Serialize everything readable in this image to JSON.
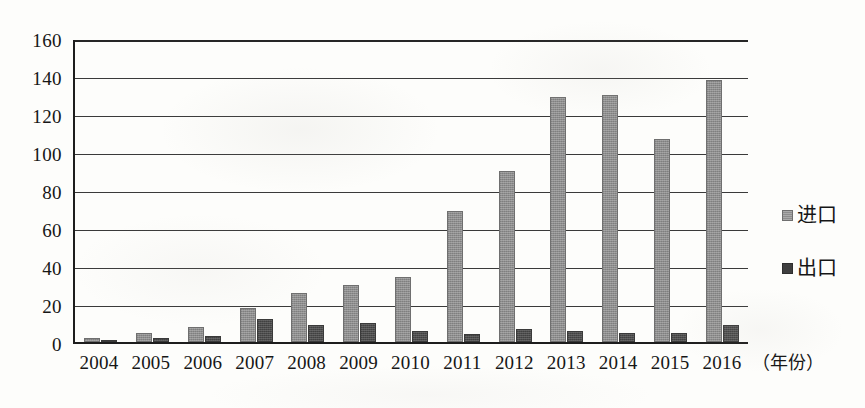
{
  "chart_data": {
    "type": "bar",
    "title": "",
    "subtitle": "",
    "xlabel": "（年份）",
    "ylabel": "",
    "ylim": [
      0,
      160
    ],
    "ytick_step": 20,
    "grid": true,
    "legend_position": "right",
    "categories": [
      "2004",
      "2005",
      "2006",
      "2007",
      "2008",
      "2009",
      "2010",
      "2011",
      "2012",
      "2013",
      "2014",
      "2015",
      "2016"
    ],
    "yticks": [
      "0",
      "20",
      "40",
      "60",
      "80",
      "100",
      "120",
      "140",
      "160"
    ],
    "series": [
      {
        "name": "进口",
        "color": "#8d8d8d",
        "values": [
          2,
          5,
          8,
          18,
          26,
          30,
          34,
          69,
          90,
          129,
          130,
          107,
          138
        ]
      },
      {
        "name": "出口",
        "color": "#4c4c4c",
        "values": [
          1,
          2,
          3,
          12,
          9,
          10,
          6,
          4,
          7,
          6,
          5,
          5,
          9
        ]
      }
    ]
  },
  "axis": {
    "x_title": "（年份）"
  },
  "legend": {
    "entries": [
      {
        "label": "进口",
        "swatch": "import-swatch-icon"
      },
      {
        "label": "出口",
        "swatch": "export-swatch-icon"
      }
    ]
  }
}
